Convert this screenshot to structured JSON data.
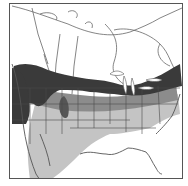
{
  "map": {
    "region": "North America",
    "type": "species-range-map",
    "legend_shades": {
      "breeding": "#3a3a3a",
      "year_round": "#8c8c8c",
      "winter": "#c4c4c4",
      "land": "#ffffff",
      "outline": "#555555"
    }
  }
}
